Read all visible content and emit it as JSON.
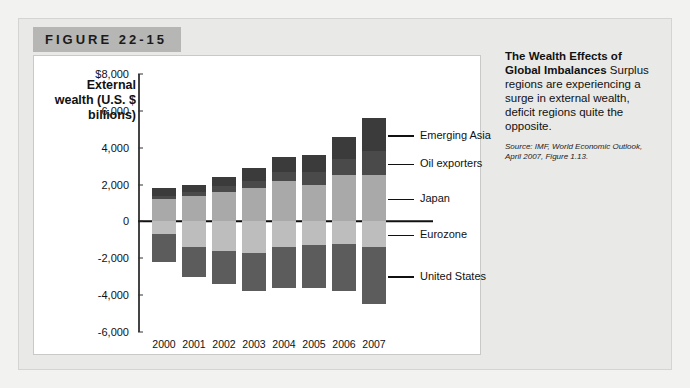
{
  "figure": {
    "number_label": "FIGURE 22-15"
  },
  "caption": {
    "headline": "The Wealth Effects of Global Imbalances",
    "body": " Surplus regions are experiencing a surge in external wealth, deficit regions quite the opposite.",
    "source": "Source: IMF, World Economic Outlook, April 2007, Figure 1.13."
  },
  "chart_data": {
    "type": "bar",
    "title": "",
    "subtype": "stacked-diverging",
    "ylabel": "External wealth (U.S. $ billions)",
    "xlabel": "",
    "ylim": [
      -6000,
      8000
    ],
    "ytick_labels": [
      "$8,000",
      "6,000",
      "4,000",
      "2,000",
      "0",
      "-2,000",
      "-4,000",
      "-6,000"
    ],
    "ytick_values": [
      8000,
      6000,
      4000,
      2000,
      0,
      -2000,
      -4000,
      -6000
    ],
    "grid": false,
    "legend_position": "right-callouts",
    "categories": [
      "2000",
      "2001",
      "2002",
      "2003",
      "2004",
      "2005",
      "2006",
      "2007"
    ],
    "series": [
      {
        "name": "Emerging Asia",
        "color": "#3b3b3b",
        "values": [
          400,
          400,
          500,
          700,
          800,
          900,
          1200,
          1800
        ]
      },
      {
        "name": "Oil exporters",
        "color": "#4a4a4a",
        "values": [
          200,
          200,
          300,
          400,
          500,
          700,
          900,
          1300
        ]
      },
      {
        "name": "Japan",
        "color": "#a9a9a9",
        "values": [
          1200,
          1400,
          1600,
          1800,
          2200,
          2000,
          2500,
          2500
        ]
      },
      {
        "name": "Eurozone",
        "color": "#bdbdbd",
        "values": [
          -700,
          -1400,
          -1600,
          -1700,
          -1400,
          -1300,
          -1200,
          -1400
        ]
      },
      {
        "name": "United States",
        "color": "#5c5c5c",
        "values": [
          -1500,
          -1600,
          -1800,
          -2100,
          -2200,
          -2300,
          -2600,
          -3100
        ]
      }
    ]
  }
}
